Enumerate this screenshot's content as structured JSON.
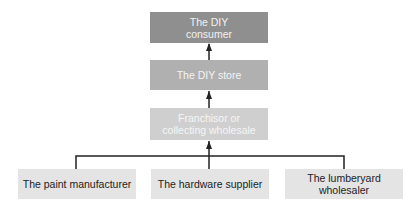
{
  "diagram": {
    "nodes": {
      "consumer": [
        "The DIY",
        "consumer"
      ],
      "store": "The DIY store",
      "wholesale": [
        "Franchisor or",
        "collecting wholesale"
      ],
      "paint": "The paint manufacturer",
      "hardware": "The hardware supplier",
      "lumber": "The lumberyard wholesaler"
    },
    "colors": {
      "level1": "#8f8f8f",
      "level2": "#b0b0b0",
      "level3": "#cfcfcf",
      "level4": "#e4e4e4",
      "connector": "#222222"
    }
  }
}
